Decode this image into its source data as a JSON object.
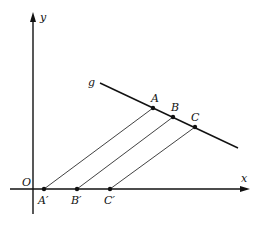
{
  "diagram": {
    "axes": {
      "x_label": "x",
      "y_label": "y",
      "origin_label": "O"
    },
    "line": {
      "label": "g"
    },
    "points_on_line": [
      {
        "label": "A"
      },
      {
        "label": "B"
      },
      {
        "label": "C"
      }
    ],
    "projected_points": [
      {
        "label": "A′"
      },
      {
        "label": "B′"
      },
      {
        "label": "C′"
      }
    ],
    "colors": {
      "stroke": "#111111",
      "background": "#ffffff"
    }
  }
}
